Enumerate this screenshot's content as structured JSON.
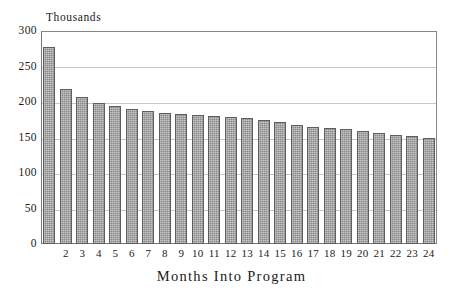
{
  "chart_data": {
    "type": "bar",
    "title": "",
    "xlabel": "Months Into Program",
    "ylabel": "",
    "unit_caption": "Thousands",
    "categories": [
      "1",
      "2",
      "3",
      "4",
      "5",
      "6",
      "7",
      "8",
      "9",
      "10",
      "11",
      "12",
      "13",
      "14",
      "15",
      "16",
      "17",
      "18",
      "19",
      "20",
      "21",
      "22",
      "23",
      "24"
    ],
    "x_tick_labels": [
      "",
      "2",
      "3",
      "4",
      "5",
      "6",
      "7",
      "8",
      "9",
      "10",
      "11",
      "12",
      "13",
      "14",
      "15",
      "16",
      "17",
      "18",
      "19",
      "20",
      "21",
      "22",
      "23",
      "24"
    ],
    "values": [
      277,
      218,
      207,
      199,
      194,
      190,
      187,
      185,
      183,
      182,
      181,
      179,
      177,
      175,
      172,
      168,
      165,
      164,
      162,
      159,
      156,
      154,
      152,
      149
    ],
    "ylim": [
      0,
      300
    ],
    "y_ticks": [
      0,
      50,
      100,
      150,
      200,
      250,
      300
    ],
    "y_tick_labels": [
      "0",
      "50",
      "100",
      "150",
      "200",
      "250",
      "300"
    ],
    "grid": true,
    "grid_axis": "y",
    "legend": false,
    "bar_color": "#8a8a8a",
    "bar_edge_color": "#5e5e5e",
    "grid_color": "#c9c9c9",
    "axis_color": "#777777",
    "text_color": "#1a1a1a"
  }
}
